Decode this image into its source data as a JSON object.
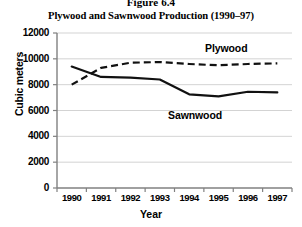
{
  "figure": {
    "number": "Figure 6.4",
    "title": "Plywood and Sawnwood Production (1990–97)"
  },
  "axes": {
    "ylabel": "Cubic meters",
    "xlabel": "Year",
    "yticks": [
      "0",
      "2000",
      "4000",
      "6000",
      "8000",
      "10000",
      "12000"
    ],
    "xticks": [
      "1990",
      "1991",
      "1992",
      "1993",
      "1994",
      "1995",
      "1996",
      "1997"
    ]
  },
  "series_labels": {
    "plywood": "Plywood",
    "sawnwood": "Sawnwood"
  },
  "colors": {
    "line": "#000000",
    "grid": "#c8c8c8",
    "axis": "#808080",
    "background": "#ffffff"
  },
  "chart_data": {
    "type": "line",
    "title": "Plywood and Sawnwood Production (1990–97)",
    "xlabel": "Year",
    "ylabel": "Cubic meters",
    "categories": [
      "1990",
      "1991",
      "1992",
      "1993",
      "1994",
      "1995",
      "1996",
      "1997"
    ],
    "ylim": [
      0,
      12000
    ],
    "ytick_step": 2000,
    "grid": true,
    "legend": "inline-labels",
    "series": [
      {
        "name": "Plywood",
        "style": "dashed",
        "values": [
          8000,
          9300,
          9700,
          9750,
          9600,
          9500,
          9600,
          9650
        ]
      },
      {
        "name": "Sawnwood",
        "style": "solid",
        "values": [
          9400,
          8600,
          8550,
          8400,
          7250,
          7100,
          7450,
          7400
        ]
      }
    ]
  }
}
